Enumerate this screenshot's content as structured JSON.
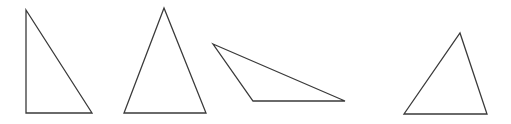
{
  "figure": {
    "background_color": "#ffffff",
    "width": 511,
    "height": 124,
    "stroke_color": "#3a3a3a",
    "stroke_width": 1.3,
    "fill": "none"
  },
  "shapes": [
    {
      "name": "triangle-1",
      "label": "Right triangle",
      "orientation": "apex-top-left, right angle at bottom-left",
      "points": "26,10 92,113 26,113",
      "vertices": [
        {
          "x": 26,
          "y": 10
        },
        {
          "x": 92,
          "y": 113
        },
        {
          "x": 26,
          "y": 113
        }
      ]
    },
    {
      "name": "triangle-2",
      "label": "Isosceles triangle",
      "orientation": "apex-top-center, horizontal base",
      "points": "164,8 206,113 124,113",
      "vertices": [
        {
          "x": 164,
          "y": 8
        },
        {
          "x": 206,
          "y": 113
        },
        {
          "x": 124,
          "y": 113
        }
      ]
    },
    {
      "name": "triangle-3",
      "label": "Obtuse scalene triangle",
      "orientation": "apex-left, long horizontal base to the right",
      "points": "213,44 345,101 253,101",
      "vertices": [
        {
          "x": 213,
          "y": 44
        },
        {
          "x": 345,
          "y": 101
        },
        {
          "x": 253,
          "y": 101
        }
      ]
    },
    {
      "name": "triangle-4",
      "label": "Scalene triangle",
      "orientation": "apex-top-right-of-center, horizontal base",
      "points": "460,33 487,114 404,114",
      "vertices": [
        {
          "x": 460,
          "y": 33
        },
        {
          "x": 487,
          "y": 114
        },
        {
          "x": 404,
          "y": 114
        }
      ]
    }
  ]
}
